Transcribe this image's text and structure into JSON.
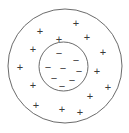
{
  "diagram": {
    "name": "atom-charge-distribution-diagram",
    "canvas": {
      "width": 129,
      "height": 133,
      "background": "#ffffff"
    },
    "stroke_color": "#6b6b6b",
    "stroke_width": 1,
    "charge_color": "#3a3a3a",
    "outer_circle": {
      "name": "outer-circle",
      "cx": 65,
      "cy": 66,
      "r": 57
    },
    "inner_circle": {
      "name": "inner-circle",
      "cx": 63.5,
      "cy": 66.5,
      "r": 24.5
    },
    "positive_symbol": "+",
    "negative_symbol": "−",
    "positive_count": 14,
    "negative_count": 8,
    "positive_font_size": 11,
    "negative_font_size": 11,
    "positive_charges": [
      {
        "x": 76,
        "y": 23
      },
      {
        "x": 40,
        "y": 31
      },
      {
        "x": 59,
        "y": 39
      },
      {
        "x": 87,
        "y": 37
      },
      {
        "x": 33,
        "y": 49
      },
      {
        "x": 103,
        "y": 52
      },
      {
        "x": 20,
        "y": 67
      },
      {
        "x": 97,
        "y": 71
      },
      {
        "x": 33,
        "y": 85
      },
      {
        "x": 108,
        "y": 87
      },
      {
        "x": 90,
        "y": 96
      },
      {
        "x": 36,
        "y": 105
      },
      {
        "x": 62,
        "y": 109
      },
      {
        "x": 80,
        "y": 112
      }
    ],
    "negative_charges": [
      {
        "x": 59,
        "y": 53
      },
      {
        "x": 76,
        "y": 60
      },
      {
        "x": 48,
        "y": 67
      },
      {
        "x": 63,
        "y": 68
      },
      {
        "x": 79,
        "y": 71
      },
      {
        "x": 54,
        "y": 78
      },
      {
        "x": 72,
        "y": 80
      },
      {
        "x": 62,
        "y": 86
      }
    ]
  }
}
